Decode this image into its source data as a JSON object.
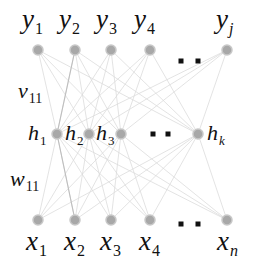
{
  "diagram": {
    "type": "three-layer neural network (input x, hidden h, output y)",
    "output_layer": {
      "nodes": [
        {
          "id": "y1",
          "base": "y",
          "sub": "1",
          "cx": 38,
          "cy": 50
        },
        {
          "id": "y2",
          "base": "y",
          "sub": "2",
          "cx": 75,
          "cy": 50
        },
        {
          "id": "y3",
          "base": "y",
          "sub": "3",
          "cx": 111,
          "cy": 50
        },
        {
          "id": "y4",
          "base": "y",
          "sub": "4",
          "cx": 150,
          "cy": 50
        },
        {
          "id": "yj",
          "base": "y",
          "sub": "j",
          "cx": 227,
          "cy": 50
        }
      ],
      "ellipsis_dots": [
        [
          181,
          61
        ],
        [
          198,
          61
        ]
      ]
    },
    "hidden_layer": {
      "nodes": [
        {
          "id": "h1",
          "base": "h",
          "sub": "1",
          "cx": 57,
          "cy": 134
        },
        {
          "id": "h2",
          "base": "h",
          "sub": "2",
          "cx": 89,
          "cy": 134
        },
        {
          "id": "h3",
          "base": "h",
          "sub": "3",
          "cx": 121,
          "cy": 134
        },
        {
          "id": "hk",
          "base": "h",
          "sub": "k",
          "cx": 198,
          "cy": 134
        }
      ],
      "ellipsis_dots": [
        [
          153,
          134
        ],
        [
          168,
          134
        ]
      ]
    },
    "input_layer": {
      "nodes": [
        {
          "id": "x1",
          "base": "x",
          "sub": "1",
          "cx": 38,
          "cy": 220
        },
        {
          "id": "x2",
          "base": "x",
          "sub": "2",
          "cx": 75,
          "cy": 220
        },
        {
          "id": "x3",
          "base": "x",
          "sub": "3",
          "cx": 111,
          "cy": 220
        },
        {
          "id": "x4",
          "base": "x",
          "sub": "4",
          "cx": 150,
          "cy": 220
        },
        {
          "id": "xn",
          "base": "x",
          "sub": "n",
          "cx": 227,
          "cy": 220
        }
      ],
      "ellipsis_dots": [
        [
          181,
          224
        ],
        [
          198,
          224
        ]
      ]
    },
    "weight_labels": [
      {
        "id": "v11",
        "base": "v",
        "sub": "11"
      },
      {
        "id": "w11",
        "base": "w",
        "sub": "11"
      }
    ],
    "colors": {
      "node_fill": "#a8a8a8",
      "node_stroke": "#c8c8c8",
      "edge": "#dcdcdc",
      "edge_highlight": "#bdbdbd",
      "dot": "#111111",
      "text": "#111111"
    }
  }
}
